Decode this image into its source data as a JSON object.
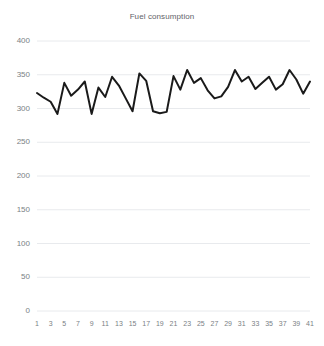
{
  "chart_data": {
    "type": "line",
    "title": "Fuel consumption",
    "xlabel": "",
    "ylabel": "",
    "ylim": [
      0,
      400
    ],
    "yticks": [
      0,
      50,
      100,
      150,
      200,
      250,
      300,
      350,
      400
    ],
    "xticks": [
      1,
      3,
      5,
      7,
      9,
      11,
      13,
      15,
      17,
      19,
      21,
      23,
      25,
      27,
      29,
      31,
      33,
      35,
      37,
      39,
      41
    ],
    "grid": true,
    "legend": false,
    "x": [
      1,
      2,
      3,
      4,
      5,
      6,
      7,
      8,
      9,
      10,
      11,
      12,
      13,
      14,
      15,
      16,
      17,
      18,
      19,
      20,
      21,
      22,
      23,
      24,
      25,
      26,
      27,
      28,
      29,
      30,
      31,
      32,
      33,
      34,
      35,
      36,
      37,
      38,
      39,
      40,
      41
    ],
    "values": [
      323,
      316,
      310,
      292,
      338,
      319,
      328,
      340,
      292,
      331,
      317,
      347,
      334,
      315,
      296,
      352,
      341,
      296,
      293,
      295,
      348,
      328,
      357,
      338,
      345,
      327,
      315,
      318,
      332,
      357,
      340,
      347,
      329,
      338,
      347,
      328,
      336,
      357,
      343,
      322,
      340
    ],
    "line_color": "#1a1a1a",
    "line_width": 2,
    "grid_color": "#e8eaed",
    "axis_label_color": "#7a7f85",
    "title_color": "#5f6368",
    "background": "#ffffff"
  },
  "labels": {
    "y": [
      "0",
      "50",
      "100",
      "150",
      "200",
      "250",
      "300",
      "350",
      "400"
    ],
    "x": [
      "1",
      "3",
      "5",
      "7",
      "9",
      "11",
      "13",
      "15",
      "17",
      "19",
      "21",
      "23",
      "25",
      "27",
      "29",
      "31",
      "33",
      "35",
      "37",
      "39",
      "41"
    ]
  }
}
